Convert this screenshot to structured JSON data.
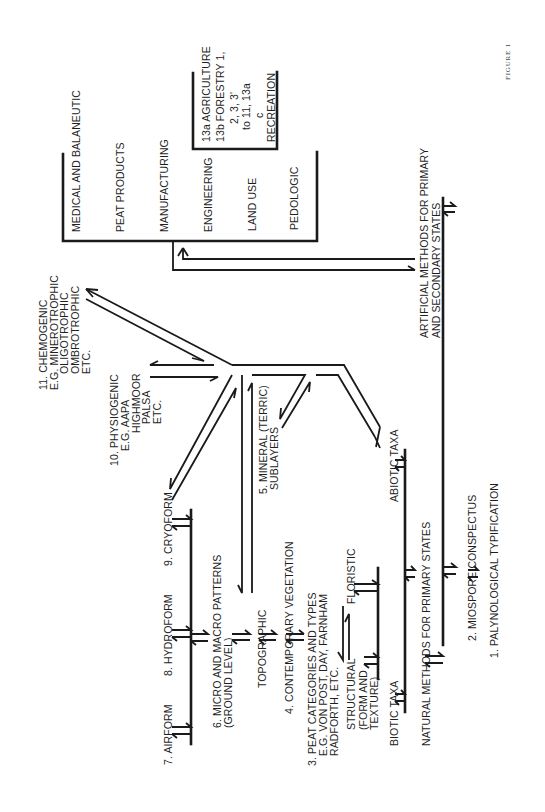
{
  "figure": {
    "caption": "FIGURE 1",
    "orientation": "rotated 90° counter-clockwise"
  },
  "outputs_bracket": {
    "items": [
      "MEDICAL AND BALANEUTIC",
      "PEAT PRODUCTS",
      "MANUFACTURING",
      "ENGINEERING",
      "LAND USE",
      "PEDOLOGIC"
    ]
  },
  "land_use_box": {
    "lines": [
      "13a AGRICULTURE",
      "13b FORESTRY 1,",
      "2, 3, 3'",
      "to 11, 13a",
      "c",
      "RECREATION"
    ]
  },
  "artificial_methods": {
    "lines": [
      "ARTIFICIAL METHODS FOR PRIMARY",
      "AND SECONDARY STATES"
    ]
  },
  "natural_methods": {
    "label": "NATURAL METHODS FOR PRIMARY STATES"
  },
  "palynological": {
    "item1": "1. PALYNOLOGICAL  TYPIFICATION",
    "item2": "2. MIOSPORE CONSPECTUS"
  },
  "taxa": {
    "abiotic": "ABIOTIC TAXA",
    "biotic": "BIOTIC TAXA"
  },
  "floristic_structural": {
    "floristic": "FLORISTIC",
    "structural": [
      "STRUCTURAL",
      "(FORM AND",
      "TEXTURE)"
    ]
  },
  "categories": {
    "c3": [
      "3. PEAT CATEGORIES AND TYPES",
      "E.G. VON POST, DAY, FARNHAM",
      "RADFORTH, ETC."
    ],
    "c4": "4. CONTEMPORARY VEGETATION",
    "c5": [
      "5. MINERAL (TERRIC)",
      "SUBLAYERS"
    ],
    "topographic": "TOPOGRAPHIC",
    "c6": [
      "6. MICRO AND MACRO PATTERNS",
      "(GROUND LEVEL)"
    ],
    "c7": "7. AIRFORM",
    "c8": "8. HYDROFORM",
    "c9": "9. CRYOFORM",
    "c10": [
      "10. PHYSIOGENIC",
      "E.G. AAPA",
      "HIGHMOOR",
      "PALSA",
      "ETC."
    ],
    "c11": [
      "11. CHEMOGENIC",
      "E.G. MINEROTROPHIC",
      "OLIGOTROPHIC",
      "OMBROTROPHIC",
      "ETC."
    ]
  }
}
